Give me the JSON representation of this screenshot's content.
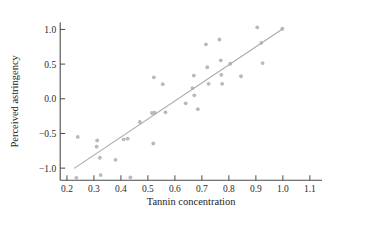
{
  "chart_data": {
    "type": "scatter",
    "title": "",
    "xlabel": "Tannin concentration",
    "ylabel": "Perceived astringency",
    "xlim": [
      0.15,
      1.15
    ],
    "ylim": [
      -1.25,
      1.15
    ],
    "grid": false,
    "legend": null,
    "xticks": [
      "0.2",
      "0.3",
      "0.4",
      "0.5",
      "0.6",
      "0.7",
      "0.8",
      "0.9",
      "1.0",
      "1.1"
    ],
    "xtick_values": [
      0.2,
      0.3,
      0.4,
      0.5,
      0.6,
      0.7,
      0.8,
      0.9,
      1.0,
      1.1
    ],
    "yticks": [
      "1.0",
      "0.5",
      "0.0",
      "-0.5",
      "-1.0"
    ],
    "ytick_values": [
      1.0,
      0.5,
      0.0,
      -0.5,
      -1.0
    ],
    "point_color": "#b9b9bd",
    "line_color": "#a9a9b0",
    "axis_color": "#4a4a4a",
    "series": [
      {
        "name": "observations",
        "marker": "circle",
        "x": [
          0.24,
          0.235,
          0.31,
          0.312,
          0.322,
          0.325,
          0.38,
          0.41,
          0.425,
          0.435,
          0.47,
          0.515,
          0.52,
          0.522,
          0.525,
          0.555,
          0.565,
          0.64,
          0.665,
          0.67,
          0.672,
          0.685,
          0.715,
          0.72,
          0.725,
          0.765,
          0.77,
          0.772,
          0.775,
          0.805,
          0.845,
          0.905,
          0.92,
          0.925,
          0.998
        ],
        "y": [
          -0.55,
          -1.14,
          -0.69,
          -0.6,
          -0.85,
          -1.1,
          -0.88,
          -0.585,
          -0.575,
          -1.135,
          -0.335,
          -0.205,
          -0.645,
          0.31,
          -0.2,
          0.21,
          -0.195,
          -0.065,
          0.155,
          0.335,
          0.05,
          -0.15,
          0.785,
          0.455,
          0.215,
          0.855,
          0.555,
          0.345,
          0.215,
          0.505,
          0.325,
          1.03,
          0.805,
          0.515,
          1.01
        ]
      }
    ],
    "fit_line": {
      "name": "least-squares fit",
      "x_start": 0.228,
      "y_start": -1.0,
      "x_end": 1.0,
      "y_end": 1.01
    }
  }
}
